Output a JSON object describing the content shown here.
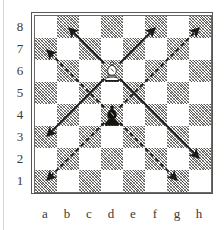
{
  "diagram": {
    "board": {
      "files": [
        "a",
        "b",
        "c",
        "d",
        "e",
        "f",
        "g",
        "h"
      ],
      "ranks": [
        "8",
        "7",
        "6",
        "5",
        "4",
        "3",
        "2",
        "1"
      ],
      "light_square_color": "#ffffff",
      "dark_square_color": "#8d8a86",
      "border_color": "#5a5753",
      "label_color": "#3b3935"
    },
    "pieces": [
      {
        "name": "white-bishop",
        "glyph": "bishop",
        "color": "white",
        "square": "d6",
        "file_index": 3,
        "rank_index": 2
      },
      {
        "name": "black-bishop",
        "glyph": "bishop",
        "color": "black",
        "square": "d4",
        "file_index": 3,
        "rank_index": 4
      }
    ],
    "arrows": [
      {
        "name": "white-bishop-arrow-up-left",
        "style": "solid",
        "from": "d6",
        "to": "b8",
        "color": "#1a1a18"
      },
      {
        "name": "white-bishop-arrow-up-right",
        "style": "solid",
        "from": "d6",
        "to": "f8",
        "color": "#1a1a18"
      },
      {
        "name": "white-bishop-arrow-down-left",
        "style": "solid",
        "from": "d6",
        "to": "a3",
        "color": "#1a1a18"
      },
      {
        "name": "white-bishop-arrow-down-right",
        "style": "solid",
        "from": "d6",
        "to": "h2",
        "color": "#1a1a18"
      },
      {
        "name": "black-bishop-arrow-up-left",
        "style": "dashed",
        "from": "d4",
        "to": "a7",
        "color": "#1a1a18"
      },
      {
        "name": "black-bishop-arrow-up-right",
        "style": "dashed",
        "from": "d4",
        "to": "h8",
        "color": "#1a1a18"
      },
      {
        "name": "black-bishop-arrow-down-left",
        "style": "dashed",
        "from": "d4",
        "to": "a1",
        "color": "#1a1a18"
      },
      {
        "name": "black-bishop-arrow-down-right",
        "style": "dashed",
        "from": "d4",
        "to": "g1",
        "color": "#1a1a18"
      }
    ]
  }
}
